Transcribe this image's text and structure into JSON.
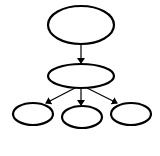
{
  "diagram": {
    "type": "tree",
    "colors": {
      "stroke": "#000000",
      "fill": "#ffffff",
      "background": "#ffffff"
    },
    "nodes": [
      {
        "id": "root",
        "label": "",
        "cx": 81,
        "cy": 25,
        "rx": 33,
        "ry": 19
      },
      {
        "id": "middle",
        "label": "",
        "cx": 81,
        "cy": 76,
        "rx": 33,
        "ry": 12
      },
      {
        "id": "child-left",
        "label": "",
        "cx": 33,
        "cy": 114,
        "rx": 20,
        "ry": 11
      },
      {
        "id": "child-center",
        "label": "",
        "cx": 82,
        "cy": 117,
        "rx": 20,
        "ry": 11
      },
      {
        "id": "child-right",
        "label": "",
        "cx": 131,
        "cy": 114,
        "rx": 20,
        "ry": 11
      }
    ],
    "edges": [
      {
        "from": "root",
        "to": "middle"
      },
      {
        "from": "middle",
        "to": "child-left"
      },
      {
        "from": "middle",
        "to": "child-center"
      },
      {
        "from": "middle",
        "to": "child-right"
      }
    ]
  }
}
